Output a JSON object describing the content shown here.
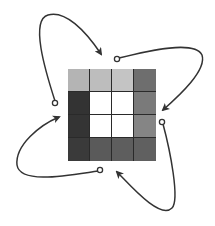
{
  "diagram": {
    "type": "grid-rotation",
    "grid": {
      "rows": 4,
      "cols": 4,
      "cells": [
        [
          "#b4b4b4",
          "#bdbdbd",
          "#c4c4c4",
          "#6e6e6e"
        ],
        [
          "#333333",
          "#ffffff",
          "#ffffff",
          "#7a7a7a"
        ],
        [
          "#343434",
          "#ffffff",
          "#ffffff",
          "#858585"
        ],
        [
          "#3a3a3a",
          "#5a5a5a",
          "#5e5e5e",
          "#606060"
        ]
      ]
    },
    "arrows": [
      {
        "name": "arrow-top-left",
        "start": [
          55,
          103
        ],
        "end": [
          102,
          55
        ],
        "path": "M55,101 C45,70 30,20 48,15 C65,10 85,30 101,54"
      },
      {
        "name": "arrow-top-right",
        "start": [
          117,
          59
        ],
        "end": [
          162,
          111
        ],
        "path": "M119,58 C150,50 195,40 202,55 C207,70 180,95 163,110"
      },
      {
        "name": "arrow-bottom-right",
        "start": [
          162,
          122
        ],
        "end": [
          116,
          171
        ],
        "path": "M163,124 C170,150 180,200 172,208 C160,220 130,185 117,172"
      },
      {
        "name": "arrow-bottom-left",
        "start": [
          100,
          170
        ],
        "end": [
          60,
          116
        ],
        "path": "M98,171 C70,175 20,185 17,165 C15,145 40,125 59,117"
      }
    ],
    "stroke_color": "#333333"
  }
}
